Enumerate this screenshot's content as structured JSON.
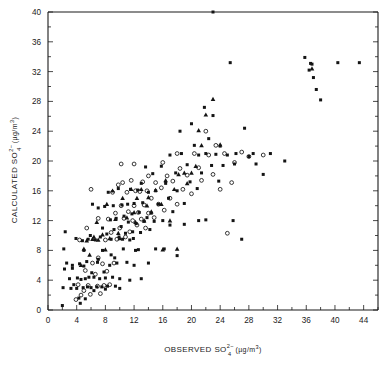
{
  "chart_data": {
    "type": "scatter",
    "title": "",
    "xlabel": "OBSERVED SO4 2- (ug/m3)",
    "ylabel": "CALCULATED SO4 2- (ug/m3)",
    "xlabel_parts": {
      "main": "OBSERVED SO",
      "sub": "4",
      "sup": "2−",
      "unit_open": "(µg/m",
      "unit_sup": "3",
      "unit_close": ")"
    },
    "ylabel_parts": {
      "main": "CALCULATED SO",
      "sub": "4",
      "sup": "2−",
      "unit_open": "(µg/m",
      "unit_sup": "3",
      "unit_close": ")"
    },
    "xlim": [
      0,
      46
    ],
    "ylim": [
      0,
      40
    ],
    "xticks": [
      0,
      4,
      8,
      12,
      16,
      20,
      24,
      28,
      32,
      36,
      40,
      44
    ],
    "yticks": [
      0,
      4,
      8,
      12,
      16,
      20,
      24,
      28,
      32,
      36,
      40
    ],
    "xtick_labels": [
      "0",
      "4",
      "8",
      "12",
      "16",
      "20",
      "24",
      "28",
      "32",
      "36",
      "40",
      "44"
    ],
    "ytick_labels": [
      "0",
      "4",
      "8",
      "12",
      "16",
      "20",
      "24",
      "28",
      "32",
      "36",
      "40"
    ],
    "x_minor_step": 2,
    "y_minor_step": 2,
    "grid": false,
    "legend": null,
    "series": [
      {
        "name": "filled-square",
        "marker": "square",
        "color": "#141414",
        "points": [
          [
            2.0,
            0.6
          ],
          [
            2.1,
            3.0
          ],
          [
            2.3,
            5.5
          ],
          [
            2.2,
            8.2
          ],
          [
            2.6,
            6.3
          ],
          [
            3.0,
            4.2
          ],
          [
            3.2,
            2.9
          ],
          [
            3.4,
            5.6
          ],
          [
            3.6,
            3.4
          ],
          [
            3.9,
            9.6
          ],
          [
            4.0,
            2.9
          ],
          [
            4.1,
            4.3
          ],
          [
            4.3,
            1.6
          ],
          [
            4.4,
            6.2
          ],
          [
            4.6,
            4.1
          ],
          [
            4.8,
            9.3
          ],
          [
            4.9,
            3.0
          ],
          [
            5.0,
            5.9
          ],
          [
            5.2,
            4.2
          ],
          [
            5.4,
            6.5
          ],
          [
            5.5,
            3.1
          ],
          [
            5.6,
            9.5
          ],
          [
            5.7,
            4.4
          ],
          [
            5.9,
            10.0
          ],
          [
            6.0,
            3.0
          ],
          [
            6.1,
            5.0
          ],
          [
            6.2,
            14.2
          ],
          [
            6.4,
            4.4
          ],
          [
            6.6,
            9.4
          ],
          [
            6.8,
            3.1
          ],
          [
            6.9,
            6.4
          ],
          [
            7.0,
            13.7
          ],
          [
            7.2,
            4.2
          ],
          [
            7.3,
            9.8
          ],
          [
            7.5,
            3.1
          ],
          [
            7.6,
            11.0
          ],
          [
            7.8,
            5.1
          ],
          [
            7.9,
            13.9
          ],
          [
            8.0,
            4.3
          ],
          [
            8.2,
            10.2
          ],
          [
            8.3,
            3.2
          ],
          [
            8.4,
            15.8
          ],
          [
            8.6,
            6.0
          ],
          [
            8.7,
            12.1
          ],
          [
            8.8,
            9.5
          ],
          [
            9.0,
            4.4
          ],
          [
            9.1,
            14.0
          ],
          [
            9.2,
            10.8
          ],
          [
            9.4,
            3.2
          ],
          [
            9.5,
            12.3
          ],
          [
            9.6,
            6.3
          ],
          [
            9.8,
            16.3
          ],
          [
            9.9,
            9.8
          ],
          [
            10.0,
            4.2
          ],
          [
            10.2,
            11.2
          ],
          [
            10.3,
            14.1
          ],
          [
            10.5,
            8.2
          ],
          [
            10.6,
            12.6
          ],
          [
            10.8,
            10.3
          ],
          [
            11.0,
            6.4
          ],
          [
            11.1,
            14.2
          ],
          [
            11.2,
            11.8
          ],
          [
            11.4,
            9.4
          ],
          [
            11.5,
            16.2
          ],
          [
            11.7,
            12.9
          ],
          [
            11.8,
            10.5
          ],
          [
            12.0,
            14.3
          ],
          [
            12.2,
            8.0
          ],
          [
            12.3,
            11.6
          ],
          [
            12.5,
            16.1
          ],
          [
            12.7,
            13.1
          ],
          [
            12.9,
            10.4
          ],
          [
            13.0,
            17.0
          ],
          [
            13.2,
            14.4
          ],
          [
            13.4,
            11.9
          ],
          [
            13.6,
            19.2
          ],
          [
            13.8,
            12.4
          ],
          [
            14.0,
            15.8
          ],
          [
            14.2,
            10.8
          ],
          [
            14.4,
            13.0
          ],
          [
            14.6,
            18.3
          ],
          [
            14.8,
            11.9
          ],
          [
            15.0,
            16.0
          ],
          [
            15.4,
            14.2
          ],
          [
            15.8,
            19.3
          ],
          [
            16.0,
            12.0
          ],
          [
            16.4,
            17.0
          ],
          [
            16.8,
            15.0
          ],
          [
            17.0,
            20.8
          ],
          [
            17.4,
            13.2
          ],
          [
            17.8,
            18.4
          ],
          [
            18.0,
            16.0
          ],
          [
            18.4,
            24.0
          ],
          [
            18.6,
            21.0
          ],
          [
            19.0,
            14.3
          ],
          [
            19.4,
            19.5
          ],
          [
            19.8,
            17.2
          ],
          [
            20.0,
            25.0
          ],
          [
            20.4,
            22.1
          ],
          [
            20.8,
            16.3
          ],
          [
            21.0,
            20.8
          ],
          [
            21.4,
            18.4
          ],
          [
            21.8,
            27.2
          ],
          [
            22.0,
            21.0
          ],
          [
            22.4,
            23.0
          ],
          [
            22.8,
            19.4
          ],
          [
            23.0,
            26.1
          ],
          [
            23.4,
            20.9
          ],
          [
            23.8,
            17.3
          ],
          [
            24.0,
            22.0
          ],
          [
            24.4,
            19.4
          ],
          [
            25.0,
            20.8
          ],
          [
            25.4,
            33.2
          ],
          [
            26.0,
            19.6
          ],
          [
            26.2,
            21.0
          ],
          [
            27.0,
            9.5
          ],
          [
            27.4,
            24.4
          ],
          [
            28.0,
            20.6
          ],
          [
            28.6,
            21.0
          ],
          [
            29.0,
            19.6
          ],
          [
            30.0,
            18.2
          ],
          [
            31.0,
            21.0
          ],
          [
            33.0,
            20.0
          ],
          [
            35.8,
            33.9
          ],
          [
            36.4,
            32.2
          ],
          [
            36.6,
            33.1
          ],
          [
            36.8,
            33.0
          ],
          [
            37.0,
            31.2
          ],
          [
            37.4,
            29.6
          ],
          [
            38.0,
            28.2
          ],
          [
            40.4,
            33.2
          ],
          [
            43.4,
            33.2
          ],
          [
            23.0,
            40.0
          ],
          [
            4.5,
            0.9
          ],
          [
            12.0,
            6.0
          ],
          [
            10.0,
            2.9
          ],
          [
            8.0,
            2.8
          ],
          [
            6.4,
            2.6
          ],
          [
            5.2,
            1.5
          ],
          [
            3.4,
            6.0
          ],
          [
            13.0,
            4.2
          ],
          [
            11.4,
            4.0
          ],
          [
            12.6,
            8.1
          ],
          [
            15.0,
            8.2
          ],
          [
            16.2,
            8.2
          ],
          [
            17.0,
            11.4
          ],
          [
            19.0,
            11.5
          ],
          [
            21.0,
            12.0
          ],
          [
            22.0,
            12.1
          ],
          [
            25.8,
            12.0
          ],
          [
            14.0,
            6.3
          ],
          [
            18.0,
            7.3
          ],
          [
            9.3,
            7.0
          ],
          [
            7.0,
            6.8
          ],
          [
            5.0,
            8.0
          ],
          [
            2.4,
            10.5
          ],
          [
            7.6,
            8.0
          ],
          [
            8.8,
            7.4
          ],
          [
            10.4,
            9.5
          ],
          [
            11.9,
            9.6
          ]
        ]
      },
      {
        "name": "open-circle",
        "marker": "circle",
        "color": "#141414",
        "points": [
          [
            3.9,
            1.4
          ],
          [
            4.2,
            3.4
          ],
          [
            4.6,
            2.0
          ],
          [
            5.0,
            2.6
          ],
          [
            5.2,
            5.3
          ],
          [
            5.6,
            3.3
          ],
          [
            5.9,
            2.1
          ],
          [
            6.2,
            6.3
          ],
          [
            6.6,
            4.8
          ],
          [
            6.9,
            3.2
          ],
          [
            7.0,
            7.0
          ],
          [
            7.3,
            2.2
          ],
          [
            7.6,
            6.2
          ],
          [
            7.8,
            3.3
          ],
          [
            8.0,
            9.4
          ],
          [
            8.2,
            5.2
          ],
          [
            8.4,
            12.2
          ],
          [
            8.6,
            3.4
          ],
          [
            8.8,
            10.4
          ],
          [
            9.0,
            15.8
          ],
          [
            9.2,
            6.3
          ],
          [
            9.4,
            13.0
          ],
          [
            9.6,
            9.5
          ],
          [
            9.8,
            16.8
          ],
          [
            10.0,
            11.0
          ],
          [
            10.2,
            14.0
          ],
          [
            10.4,
            17.1
          ],
          [
            10.6,
            12.3
          ],
          [
            10.8,
            9.8
          ],
          [
            11.0,
            15.8
          ],
          [
            11.2,
            13.2
          ],
          [
            11.4,
            10.5
          ],
          [
            11.6,
            17.4
          ],
          [
            11.8,
            12.0
          ],
          [
            12.0,
            14.0
          ],
          [
            12.2,
            16.0
          ],
          [
            12.4,
            11.4
          ],
          [
            12.6,
            13.1
          ],
          [
            12.8,
            15.9
          ],
          [
            13.0,
            12.2
          ],
          [
            13.2,
            17.2
          ],
          [
            13.4,
            14.1
          ],
          [
            13.6,
            11.0
          ],
          [
            13.8,
            16.0
          ],
          [
            14.0,
            13.0
          ],
          [
            14.4,
            15.0
          ],
          [
            14.8,
            12.4
          ],
          [
            15.0,
            17.1
          ],
          [
            15.4,
            14.2
          ],
          [
            15.8,
            16.4
          ],
          [
            16.2,
            13.4
          ],
          [
            16.6,
            18.0
          ],
          [
            17.0,
            15.0
          ],
          [
            17.4,
            17.3
          ],
          [
            18.0,
            14.2
          ],
          [
            18.4,
            19.0
          ],
          [
            18.8,
            16.2
          ],
          [
            19.4,
            18.1
          ],
          [
            20.0,
            15.6
          ],
          [
            20.4,
            21.0
          ],
          [
            21.0,
            19.1
          ],
          [
            21.4,
            17.4
          ],
          [
            22.0,
            24.0
          ],
          [
            22.4,
            20.8
          ],
          [
            23.0,
            18.2
          ],
          [
            23.4,
            22.1
          ],
          [
            24.0,
            16.2
          ],
          [
            24.6,
            21.0
          ],
          [
            25.0,
            10.3
          ],
          [
            25.6,
            17.1
          ],
          [
            26.0,
            19.8
          ],
          [
            27.0,
            21.2
          ],
          [
            28.0,
            20.6
          ],
          [
            30.0,
            20.8
          ],
          [
            10.2,
            19.6
          ],
          [
            12.0,
            19.6
          ],
          [
            14.0,
            18.0
          ],
          [
            16.0,
            19.8
          ],
          [
            18.0,
            21.0
          ],
          [
            6.0,
            16.2
          ],
          [
            7.0,
            12.3
          ],
          [
            4.4,
            9.4
          ],
          [
            5.4,
            11.0
          ]
        ]
      },
      {
        "name": "filled-triangle",
        "marker": "triangle",
        "color": "#141414",
        "points": [
          [
            4.6,
            6.0
          ],
          [
            5.4,
            9.3
          ],
          [
            5.8,
            7.4
          ],
          [
            6.4,
            9.8
          ],
          [
            7.0,
            9.4
          ],
          [
            7.6,
            10.1
          ],
          [
            8.2,
            14.2
          ],
          [
            8.6,
            9.6
          ],
          [
            9.0,
            16.0
          ],
          [
            9.4,
            12.2
          ],
          [
            9.8,
            10.3
          ],
          [
            10.4,
            15.0
          ],
          [
            11.0,
            12.4
          ],
          [
            11.6,
            16.2
          ],
          [
            12.0,
            13.1
          ],
          [
            12.4,
            15.0
          ],
          [
            13.0,
            16.2
          ],
          [
            13.4,
            12.0
          ],
          [
            14.0,
            15.1
          ],
          [
            14.4,
            13.2
          ],
          [
            15.0,
            16.1
          ],
          [
            15.8,
            14.2
          ],
          [
            16.4,
            17.4
          ],
          [
            17.0,
            12.0
          ],
          [
            17.6,
            16.2
          ],
          [
            18.2,
            18.2
          ],
          [
            19.0,
            18.4
          ],
          [
            19.4,
            17.0
          ],
          [
            20.0,
            18.4
          ],
          [
            20.6,
            19.3
          ],
          [
            21.0,
            24.1
          ],
          [
            21.4,
            22.1
          ],
          [
            22.0,
            26.2
          ],
          [
            23.0,
            28.3
          ],
          [
            24.0,
            22.2
          ],
          [
            12.2,
            11.8
          ],
          [
            10.0,
            9.6
          ],
          [
            8.0,
            8.1
          ],
          [
            6.8,
            11.8
          ],
          [
            6.2,
            9.5
          ],
          [
            5.0,
            8.2
          ],
          [
            13.8,
            14.0
          ],
          [
            16.0,
            8.1
          ],
          [
            18.0,
            8.2
          ],
          [
            36.8,
            32.4
          ]
        ]
      }
    ]
  }
}
